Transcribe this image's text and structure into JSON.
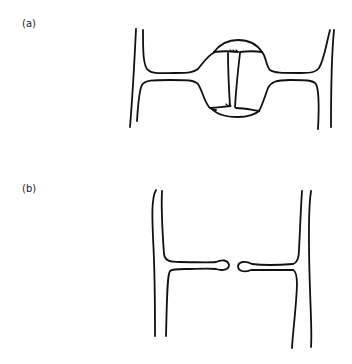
{
  "panels": [
    {
      "id": "a",
      "label": "(a)",
      "description": "Two cell walls joined by a plasmodesma-like channel with central swelling (bulge) spanning the middle lamella"
    },
    {
      "id": "b",
      "label": "(b)",
      "description": "Two cell walls with opposing projections ending in rounded knobs separated by a gap"
    }
  ],
  "colors": {
    "ink": "#111111",
    "background": "#ffffff"
  }
}
